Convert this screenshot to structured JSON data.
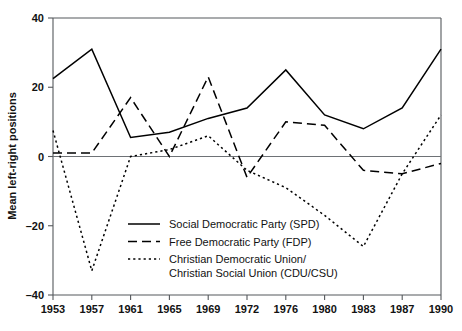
{
  "chart_data": {
    "type": "line",
    "title": "",
    "xlabel": "",
    "ylabel": "Mean left-right positions",
    "categories": [
      "1953",
      "1957",
      "1961",
      "1965",
      "1969",
      "1972",
      "1976",
      "1980",
      "1983",
      "1987",
      "1990"
    ],
    "ylim": [
      -40,
      40
    ],
    "yticks": [
      40,
      20,
      0,
      -20,
      -40
    ],
    "ytick_labels": [
      "40",
      "20",
      "0",
      "–20",
      "–40"
    ],
    "grid": false,
    "zero_line": true,
    "legend_position": "center",
    "series": [
      {
        "name": "Social Democratic Party (SPD)",
        "key": "spd",
        "style": "solid",
        "dash": "none",
        "color": "#000000",
        "values": [
          22.5,
          31,
          5.5,
          7,
          11,
          14,
          25,
          12,
          8,
          14,
          31
        ]
      },
      {
        "name": "Free Democratic Party (FDP)",
        "key": "fdp",
        "style": "dashed",
        "dash": "9,5",
        "color": "#000000",
        "values": [
          1,
          1,
          17,
          0,
          23,
          -6,
          10,
          9,
          -4,
          -5,
          -2
        ]
      },
      {
        "name": "Christian Democratic Union/Christian Social Union (CDU/CSU)",
        "key": "cdu",
        "style": "dotted",
        "dash": "2.2,3",
        "color": "#000000",
        "values": [
          7.5,
          -33,
          0,
          2,
          6,
          -4,
          -9,
          -17,
          -26,
          -5,
          12
        ]
      }
    ]
  },
  "legend": {
    "entries": [
      {
        "label": "Social Democratic Party (SPD)",
        "label2": ""
      },
      {
        "label": "Free Democratic Party (FDP)",
        "label2": ""
      },
      {
        "label": "Christian Democratic Union/",
        "label2": "Christian Social Union (CDU/CSU)"
      }
    ]
  }
}
